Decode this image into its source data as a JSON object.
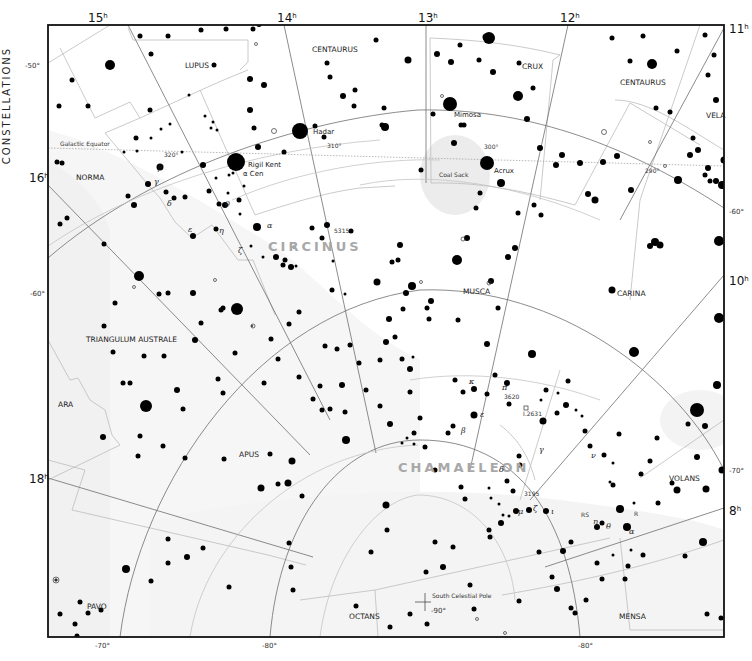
{
  "side_title": "CONSTELLATIONS",
  "hour_labels": [
    {
      "text": "15",
      "sup": "h",
      "x": 88,
      "y": 22
    },
    {
      "text": "14",
      "sup": "h",
      "x": 277,
      "y": 22
    },
    {
      "text": "13",
      "sup": "h",
      "x": 418,
      "y": 22
    },
    {
      "text": "12",
      "sup": "h",
      "x": 560,
      "y": 22
    },
    {
      "text": "11",
      "sup": "h",
      "x": 729,
      "y": 33
    },
    {
      "text": "16",
      "sup": "h",
      "x": 29,
      "y": 182
    },
    {
      "text": "10",
      "sup": "h",
      "x": 729,
      "y": 285
    },
    {
      "text": "18",
      "sup": "h",
      "x": 29,
      "y": 483
    },
    {
      "text": "8",
      "sup": "h",
      "x": 729,
      "y": 515
    }
  ],
  "declination_labels": [
    {
      "text": "-50°",
      "x": 25,
      "y": 68
    },
    {
      "text": "-60°",
      "x": 30,
      "y": 296
    },
    {
      "text": "-60°",
      "x": 729,
      "y": 214
    },
    {
      "text": "-70°",
      "x": 729,
      "y": 473
    },
    {
      "text": "-70°",
      "x": 95,
      "y": 648
    },
    {
      "text": "-80°",
      "x": 262,
      "y": 648
    },
    {
      "text": "-80°",
      "x": 578,
      "y": 648
    },
    {
      "text": "-90°",
      "x": 431,
      "y": 613
    }
  ],
  "constellations": [
    {
      "name": "LUPUS",
      "x": 185,
      "y": 68
    },
    {
      "name": "CENTAURUS",
      "x": 312,
      "y": 52
    },
    {
      "name": "CRUX",
      "x": 522,
      "y": 69
    },
    {
      "name": "CENTAURUS",
      "x": 620,
      "y": 85
    },
    {
      "name": "VELA",
      "x": 706,
      "y": 118
    },
    {
      "name": "NORMA",
      "x": 76,
      "y": 180
    },
    {
      "name": "MUSCA",
      "x": 463,
      "y": 294
    },
    {
      "name": "CARINA",
      "x": 617,
      "y": 296
    },
    {
      "name": "TRIANGULUM AUSTRALE",
      "x": 86,
      "y": 342
    },
    {
      "name": "ARA",
      "x": 58,
      "y": 407
    },
    {
      "name": "APUS",
      "x": 239,
      "y": 457
    },
    {
      "name": "VOLANS",
      "x": 669,
      "y": 481
    },
    {
      "name": "PAVO",
      "x": 87,
      "y": 609
    },
    {
      "name": "OCTANS",
      "x": 349,
      "y": 619
    },
    {
      "name": "MENSA",
      "x": 619,
      "y": 619
    }
  ],
  "highlight_constellations": [
    {
      "name": "CIRCINUS",
      "x": 268,
      "y": 251
    },
    {
      "name": "CHAMAELEON",
      "x": 398,
      "y": 472
    }
  ],
  "star_names": [
    {
      "name": "Hadar",
      "x": 313,
      "y": 134
    },
    {
      "name": "Rigil Kent",
      "x": 248,
      "y": 167
    },
    {
      "name": "α Cen",
      "x": 243,
      "y": 176
    },
    {
      "name": "Mimosa",
      "x": 454,
      "y": 117
    },
    {
      "name": "Acrux",
      "x": 494,
      "y": 173
    }
  ],
  "annotations": [
    {
      "text": "Galactic Equator",
      "x": 60,
      "y": 146
    },
    {
      "text": "320°",
      "x": 164,
      "y": 157
    },
    {
      "text": "310°",
      "x": 327,
      "y": 148
    },
    {
      "text": "300°",
      "x": 484,
      "y": 149
    },
    {
      "text": "290°",
      "x": 645,
      "y": 173
    },
    {
      "text": "Coal Sack",
      "x": 439,
      "y": 177
    },
    {
      "text": "5315",
      "x": 334,
      "y": 233
    },
    {
      "text": "3620",
      "x": 504,
      "y": 399
    },
    {
      "text": "I.2631",
      "x": 523,
      "y": 416
    },
    {
      "text": "3195",
      "x": 524,
      "y": 496
    },
    {
      "text": "RS",
      "x": 581,
      "y": 517
    },
    {
      "text": "R",
      "x": 634,
      "y": 516
    },
    {
      "text": "South Celestial Pole",
      "x": 432,
      "y": 598
    }
  ],
  "greek_labels": [
    {
      "t": "β",
      "x": 158,
      "y": 170
    },
    {
      "t": "γ",
      "x": 154,
      "y": 184
    },
    {
      "t": "δ",
      "x": 167,
      "y": 206
    },
    {
      "t": "θ",
      "x": 225,
      "y": 207
    },
    {
      "t": "ε",
      "x": 188,
      "y": 232
    },
    {
      "t": "η",
      "x": 219,
      "y": 233
    },
    {
      "t": "α",
      "x": 267,
      "y": 228
    },
    {
      "t": "ζ",
      "x": 238,
      "y": 253
    },
    {
      "t": "κ",
      "x": 469,
      "y": 384
    },
    {
      "t": "π",
      "x": 502,
      "y": 390
    },
    {
      "t": "ε",
      "x": 480,
      "y": 417
    },
    {
      "t": "β",
      "x": 461,
      "y": 433
    },
    {
      "t": "γ",
      "x": 539,
      "y": 452
    },
    {
      "t": "ν",
      "x": 591,
      "y": 458
    },
    {
      "t": "δ",
      "x": 499,
      "y": 472
    },
    {
      "t": "μ",
      "x": 518,
      "y": 514
    },
    {
      "t": "ζ",
      "x": 533,
      "y": 511
    },
    {
      "t": "ι",
      "x": 551,
      "y": 514
    },
    {
      "t": "η",
      "x": 593,
      "y": 524
    },
    {
      "t": "θ",
      "x": 606,
      "y": 529
    },
    {
      "t": "α",
      "x": 629,
      "y": 534
    }
  ],
  "top_cropped_text": "",
  "colors": {
    "frame": "#111111",
    "grid": "#666666",
    "boundary": "#bdbdbd",
    "milkyway": "#efefef",
    "star": "#000000",
    "highlight_name": "#a8a8a8"
  }
}
